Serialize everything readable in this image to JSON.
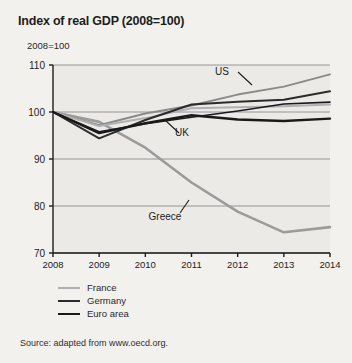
{
  "title": "Index of real GDP (2008=100)",
  "y_unit_label": "2008=100",
  "source_note": "Source: adapted from www.oecd.org.",
  "legend": {
    "items": [
      {
        "label": "France",
        "color": "#b0b0b0",
        "width": 2.0
      },
      {
        "label": "Germany",
        "color": "#2b2b2b",
        "width": 2.0
      },
      {
        "label": "Euro area",
        "color": "#1a1a1a",
        "width": 2.4
      }
    ]
  },
  "annotations": [
    {
      "name": "us-label",
      "text": "US",
      "x": 222,
      "y": 75
    },
    {
      "name": "uk-label",
      "text": "UK",
      "x": 182,
      "y": 136
    },
    {
      "name": "greece-label",
      "text": "Greece",
      "x": 165,
      "y": 220
    }
  ],
  "chart_data": {
    "type": "line",
    "title": "Index of real GDP (2008=100)",
    "xlabel": "",
    "ylabel": "2008=100",
    "x": [
      2008,
      2009,
      2010,
      2011,
      2012,
      2013,
      2014
    ],
    "xlim": [
      2008,
      2014
    ],
    "ylim": [
      70,
      110
    ],
    "yticks": [
      70,
      80,
      90,
      100,
      110
    ],
    "xticks": [
      "2008",
      "2009",
      "2010",
      "2011",
      "2012",
      "2013",
      "2014"
    ],
    "grid": true,
    "legend_position": "below-left",
    "series": [
      {
        "name": "US",
        "color": "#8a8a8a",
        "width": 2.0,
        "labelled_on_chart": true,
        "values": [
          100.0,
          97.2,
          99.7,
          101.4,
          103.7,
          105.4,
          108.0
        ]
      },
      {
        "name": "Germany",
        "color": "#2b2b2b",
        "width": 2.0,
        "labelled_on_chart": false,
        "values": [
          100.0,
          94.4,
          98.3,
          101.6,
          102.2,
          102.6,
          104.4
        ]
      },
      {
        "name": "UK",
        "color": "#1a1a1a",
        "width": 1.6,
        "labelled_on_chart": true,
        "values": [
          100.0,
          95.8,
          97.5,
          98.9,
          100.2,
          101.7,
          102.1
        ]
      },
      {
        "name": "France",
        "color": "#b0b0b0",
        "width": 2.0,
        "labelled_on_chart": false,
        "values": [
          100.0,
          97.0,
          98.7,
          100.8,
          101.0,
          101.2,
          101.6
        ]
      },
      {
        "name": "Euro area",
        "color": "#1a1a1a",
        "width": 2.4,
        "labelled_on_chart": false,
        "values": [
          100.0,
          95.5,
          97.6,
          99.3,
          98.4,
          98.1,
          98.6
        ]
      },
      {
        "name": "Greece",
        "color": "#9b9b9b",
        "width": 2.6,
        "labelled_on_chart": true,
        "values": [
          100.0,
          97.9,
          92.4,
          85.0,
          78.8,
          74.4,
          75.5
        ]
      }
    ]
  }
}
